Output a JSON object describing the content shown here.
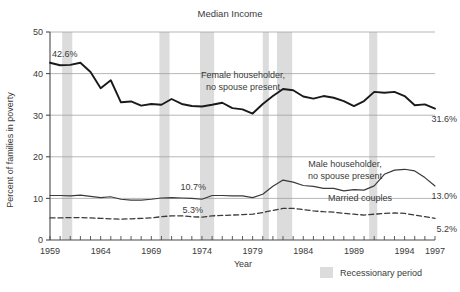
{
  "chart_data": {
    "type": "line",
    "title": "Median Income",
    "xlabel": "Year",
    "ylabel": "Percent of families in poverty",
    "xlim": [
      1959,
      1997
    ],
    "ylim": [
      0,
      50
    ],
    "yticks": [
      0,
      10,
      20,
      30,
      40,
      50
    ],
    "xticks": [
      1959,
      1964,
      1969,
      1974,
      1979,
      1984,
      1989,
      1994,
      1997
    ],
    "grid": true,
    "legend_position": "bottom-right",
    "x": [
      1959,
      1960,
      1961,
      1962,
      1963,
      1964,
      1965,
      1966,
      1967,
      1968,
      1969,
      1970,
      1971,
      1972,
      1973,
      1974,
      1975,
      1976,
      1977,
      1978,
      1979,
      1980,
      1981,
      1982,
      1983,
      1984,
      1985,
      1986,
      1987,
      1988,
      1989,
      1990,
      1991,
      1992,
      1993,
      1994,
      1995,
      1996,
      1997
    ],
    "series": [
      {
        "name": "Female householder, no spouse present",
        "style": "solid-thick",
        "color": "#1a1a1a",
        "values": [
          42.6,
          42.0,
          42.1,
          42.6,
          40.4,
          36.5,
          38.4,
          33.1,
          33.3,
          32.3,
          32.7,
          32.5,
          33.9,
          32.7,
          32.2,
          32.1,
          32.5,
          33.0,
          31.7,
          31.4,
          30.4,
          32.7,
          34.6,
          36.3,
          36.0,
          34.5,
          34.0,
          34.6,
          34.2,
          33.4,
          32.2,
          33.4,
          35.6,
          35.4,
          35.6,
          34.6,
          32.4,
          32.6,
          31.6
        ]
      },
      {
        "name": "Male householder, no spouse present",
        "style": "solid-thin",
        "color": "#3a3a3a",
        "values": [
          10.7,
          10.7,
          10.6,
          10.8,
          10.5,
          10.2,
          10.4,
          9.8,
          9.6,
          9.6,
          9.8,
          10.1,
          10.2,
          10.1,
          10.0,
          9.8,
          10.7,
          10.7,
          10.6,
          10.6,
          10.2,
          11.0,
          12.9,
          14.4,
          13.9,
          13.1,
          12.9,
          12.4,
          12.4,
          11.8,
          12.1,
          12.0,
          13.0,
          15.8,
          16.8,
          17.0,
          16.6,
          15.0,
          13.0
        ]
      },
      {
        "name": "Married couples",
        "style": "dashed",
        "color": "#3a3a3a",
        "values": [
          5.3,
          5.3,
          5.4,
          5.4,
          5.3,
          5.2,
          5.1,
          5.0,
          5.1,
          5.2,
          5.3,
          5.6,
          5.8,
          5.8,
          5.6,
          5.5,
          5.8,
          5.9,
          6.0,
          6.1,
          6.2,
          6.6,
          7.1,
          7.6,
          7.6,
          7.3,
          7.0,
          6.8,
          6.7,
          6.4,
          6.2,
          6.0,
          6.2,
          6.4,
          6.5,
          6.4,
          6.0,
          5.6,
          5.2
        ]
      }
    ],
    "point_labels": [
      {
        "text": "42.6%",
        "x": 1959,
        "y": 42.6,
        "anchor": "start"
      },
      {
        "text": "31.6%",
        "x": 1997,
        "y": 31.6,
        "anchor": "end"
      },
      {
        "text": "10.7%",
        "x": 1974,
        "y": 10.7,
        "anchor": "end"
      },
      {
        "text": "13.0%",
        "x": 1997,
        "y": 13.0,
        "anchor": "end"
      },
      {
        "text": "5.3%",
        "x": 1974,
        "y": 5.3,
        "anchor": "end"
      },
      {
        "text": "5.2%",
        "x": 1997,
        "y": 5.2,
        "anchor": "end"
      }
    ],
    "annotations": [
      {
        "text_line1": "Female householder,",
        "text_line2": "no spouse present"
      },
      {
        "text_line1": "Male householder,",
        "text_line2": "no spouse present"
      },
      {
        "text_line1": "Married couples",
        "text_line2": ""
      }
    ],
    "recession_bands": [
      {
        "start": 1960.2,
        "end": 1961.2
      },
      {
        "start": 1969.8,
        "end": 1970.8
      },
      {
        "start": 1973.8,
        "end": 1975.2
      },
      {
        "start": 1980.0,
        "end": 1980.6
      },
      {
        "start": 1981.4,
        "end": 1982.9
      },
      {
        "start": 1990.5,
        "end": 1991.3
      }
    ],
    "legend": [
      {
        "label": "Recessionary period",
        "color": "#dcdcdc"
      }
    ],
    "colors": {
      "band": "#dcdcdc",
      "grid": "#9a9a9a",
      "axis": "#4a4a4a",
      "series_primary": "#1a1a1a",
      "series_secondary": "#3a3a3a"
    }
  }
}
